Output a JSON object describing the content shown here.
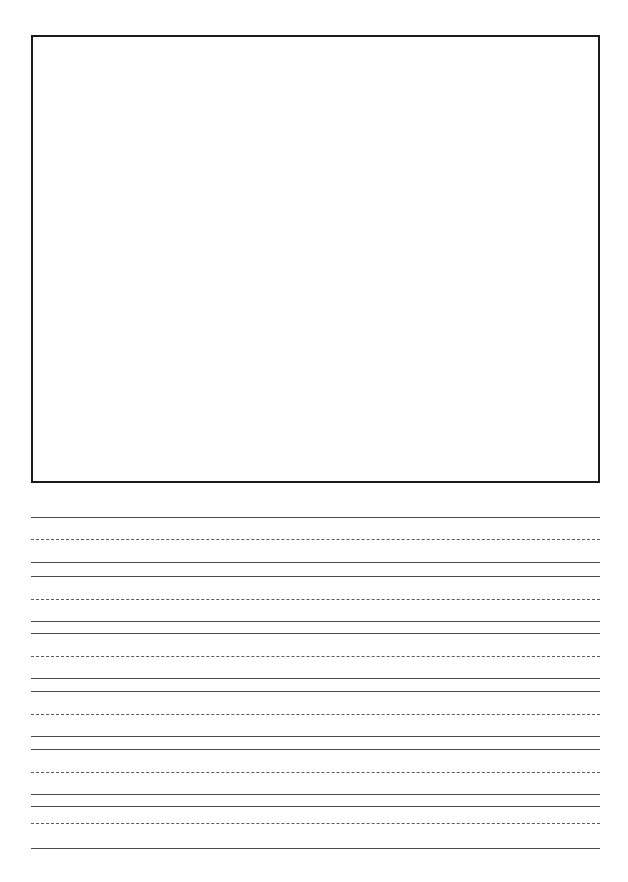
{
  "page": {
    "kind": "handwriting-practice-worksheet",
    "width": 628,
    "height": 882,
    "background_color": "#ffffff"
  },
  "drawing_box": {
    "name": "illustration-box",
    "content": "",
    "left": 31,
    "top": 35,
    "width": 569,
    "height": 448,
    "border_width": 2.5,
    "border_color": "#1b1b1b",
    "fill_color": "#ffffff"
  },
  "writing_area": {
    "left": 31,
    "right": 600,
    "line_left": 31,
    "line_width": 569,
    "solid_color": "#4a4a4a",
    "dashed_color": "#5d5d5d",
    "group_count": 6,
    "lines_per_group": 3,
    "line_roles": [
      "top-solid",
      "middle-dashed",
      "baseline-solid"
    ],
    "groups": [
      {
        "index": 1,
        "top": 517,
        "middle": 539,
        "baseline": 562
      },
      {
        "index": 2,
        "top": 576,
        "middle": 599,
        "baseline": 621
      },
      {
        "index": 3,
        "top": 633,
        "middle": 656,
        "baseline": 678
      },
      {
        "index": 4,
        "top": 691,
        "middle": 714,
        "baseline": 736
      },
      {
        "index": 5,
        "top": 749,
        "middle": 772,
        "baseline": 794
      },
      {
        "index": 6,
        "top": 806,
        "middle": 823,
        "baseline": 848
      }
    ]
  }
}
